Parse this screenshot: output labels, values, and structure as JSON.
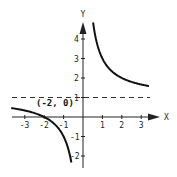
{
  "chart_data": {
    "type": "line",
    "title": "",
    "xlabel": "X",
    "ylabel": "Y",
    "function": "y = 1 + 2/x",
    "xlim": [
      -3.7,
      3.5
    ],
    "ylim": [
      -2.6,
      4.6
    ],
    "x_ticks": [
      -3,
      -2,
      -1,
      1,
      2,
      3
    ],
    "x_tick_labels": [
      "-3",
      "-2",
      "-1",
      "1",
      "2",
      "3"
    ],
    "y_ticks": [
      -2,
      -1,
      1,
      2,
      3,
      4
    ],
    "y_tick_labels": [
      "-2",
      "-1",
      "1",
      "2",
      "3",
      "4"
    ],
    "grid": false,
    "asymptotes": {
      "vertical": 0,
      "horizontal": 1,
      "horizontal_style": "dashed"
    },
    "annotations": [
      {
        "text": "(-2, 0)",
        "x": -2,
        "y": 0
      }
    ],
    "series": [
      {
        "name": "left-branch",
        "x": [
          -3.7,
          -3,
          -2,
          -1.5,
          -1,
          -0.8,
          -0.6
        ],
        "y": [
          0.46,
          0.33,
          0,
          -0.33,
          -1,
          -1.5,
          -2.33
        ]
      },
      {
        "name": "right-branch",
        "x": [
          0.52,
          0.75,
          1,
          1.5,
          2,
          2.5,
          3,
          3.4
        ],
        "y": [
          4.5,
          3.67,
          3,
          2.33,
          2,
          1.8,
          1.67,
          1.59
        ]
      }
    ]
  },
  "labels": {
    "x_axis": "X",
    "y_axis": "Y",
    "point": "(-2, 0)"
  },
  "style": {
    "curve_color": "#111111",
    "axis_color": "#222222",
    "dash_color": "#333333"
  }
}
